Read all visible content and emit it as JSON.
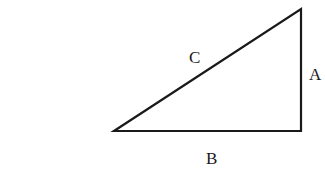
{
  "diagram": {
    "type": "right-triangle",
    "vertices": {
      "left": [
        114,
        131
      ],
      "right_bottom": [
        301,
        131
      ],
      "right_top": [
        301,
        9
      ]
    },
    "labels": {
      "hypotenuse": "C",
      "vertical_side": "A",
      "horizontal_side": "B"
    },
    "stroke_color": "#1a1a1a",
    "background": "#ffffff"
  }
}
